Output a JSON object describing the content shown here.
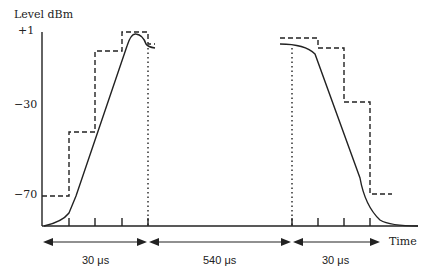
{
  "title": "Level dBm",
  "y_labels": [
    {
      "text": "+1",
      "y": 32
    },
    {
      "text": "−30",
      "y": 106
    },
    {
      "text": "−70",
      "y": 196
    }
  ],
  "x_axis_label": "Time",
  "durations": [
    {
      "text": "30 μs"
    },
    {
      "text": "540 μs"
    },
    {
      "text": "30 μs"
    }
  ],
  "colors": {
    "line": "#222222"
  }
}
